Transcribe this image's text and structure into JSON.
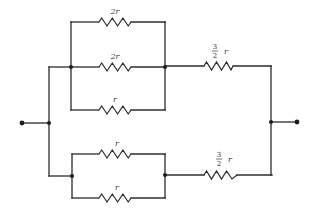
{
  "diagram": {
    "type": "resistor-network",
    "line_color": "#2b2b2b",
    "upper_group": {
      "resistors": [
        {
          "id": "R1",
          "label": "2r",
          "branch": "top"
        },
        {
          "id": "R2",
          "label": "2r",
          "branch": "middle"
        },
        {
          "id": "R3",
          "label": "r",
          "branch": "bottom"
        }
      ],
      "series_resistor": {
        "id": "R4",
        "num": "3",
        "den": "2",
        "var": "r"
      }
    },
    "lower_group": {
      "resistors": [
        {
          "id": "R5",
          "label": "r",
          "branch": "top"
        },
        {
          "id": "R6",
          "label": "r",
          "branch": "bottom"
        }
      ],
      "series_resistor": {
        "id": "R7",
        "num": "3",
        "den": "2",
        "var": "r"
      }
    },
    "terminals": [
      "left-terminal",
      "right-terminal"
    ]
  }
}
